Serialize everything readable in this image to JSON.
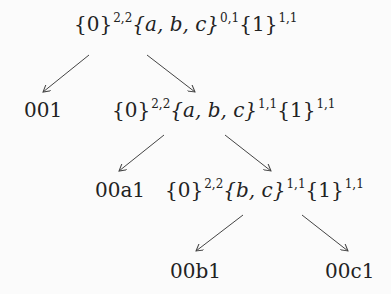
{
  "diagram": {
    "type": "tree",
    "nodes": [
      {
        "id": "root",
        "segments": [
          {
            "set": "{0}",
            "sup": "2,2"
          },
          {
            "set": "{a, b, c}",
            "sup": "0,1"
          },
          {
            "set": "{1}",
            "sup": "1,1"
          }
        ]
      },
      {
        "id": "leaf-001",
        "label": "001"
      },
      {
        "id": "n2",
        "segments": [
          {
            "set": "{0}",
            "sup": "2,2"
          },
          {
            "set": "{a, b, c}",
            "sup": "1,1"
          },
          {
            "set": "{1}",
            "sup": "1,1"
          }
        ]
      },
      {
        "id": "leaf-00a1",
        "label": "00a1"
      },
      {
        "id": "n3",
        "segments": [
          {
            "set": "{0}",
            "sup": "2,2"
          },
          {
            "set": "{b, c}",
            "sup": "1,1"
          },
          {
            "set": "{1}",
            "sup": "1,1"
          }
        ]
      },
      {
        "id": "leaf-00b1",
        "label": "00b1"
      },
      {
        "id": "leaf-00c1",
        "label": "00c1"
      }
    ],
    "edges": [
      {
        "from": "root",
        "to": "leaf-001"
      },
      {
        "from": "root",
        "to": "n2"
      },
      {
        "from": "n2",
        "to": "leaf-00a1"
      },
      {
        "from": "n2",
        "to": "n3"
      },
      {
        "from": "n3",
        "to": "leaf-00b1"
      },
      {
        "from": "n3",
        "to": "leaf-00c1"
      }
    ],
    "colors": {
      "ink": "#222222",
      "background": "#fbfbfb"
    }
  }
}
